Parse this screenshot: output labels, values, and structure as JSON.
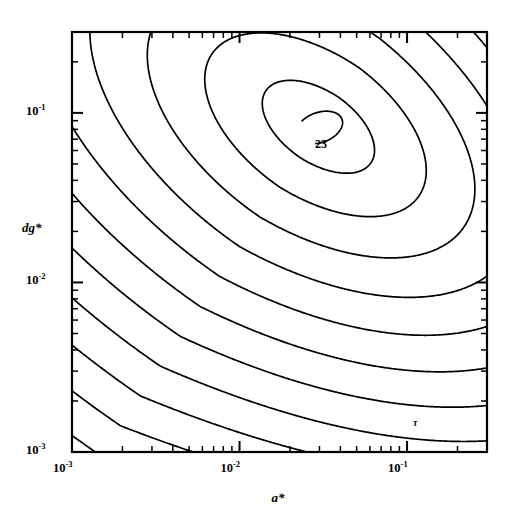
{
  "figure": {
    "background_color": "#ffffff",
    "line_color": "#000000",
    "frame": {
      "left": 72,
      "top": 32,
      "right": 487,
      "bottom": 452
    }
  },
  "axes": {
    "x": {
      "title": "a*",
      "scale": "log",
      "min": 0.001,
      "max": 0.3,
      "tick_labels": [
        {
          "mantissa": "10",
          "exponent": "-3",
          "value": 0.001
        },
        {
          "mantissa": "10",
          "exponent": "-2",
          "value": 0.01
        },
        {
          "mantissa": "10",
          "exponent": "-1",
          "value": 0.1
        }
      ]
    },
    "y": {
      "title": "dg*",
      "scale": "log",
      "min": 0.001,
      "max": 0.3,
      "tick_labels": [
        {
          "mantissa": "10",
          "exponent": "-1",
          "value": 0.1
        },
        {
          "mantissa": "10",
          "exponent": "-2",
          "value": 0.01
        },
        {
          "mantissa": "10",
          "exponent": "-3",
          "value": 0.001
        }
      ]
    }
  },
  "annotations": [
    {
      "name": "peak-contour-label",
      "text": "23",
      "x_px": 315,
      "y_px": 137
    },
    {
      "name": "tau-region-label",
      "text": "τ",
      "x_px": 413,
      "y_px": 417
    }
  ],
  "chart_data": {
    "type": "contour",
    "title": "",
    "xlabel": "a*",
    "ylabel": "dg*",
    "xscale": "log",
    "yscale": "log",
    "xlim": [
      0.001,
      0.3
    ],
    "ylim": [
      0.001,
      0.3
    ],
    "grid": false,
    "legend": null,
    "labeled_contour_levels": [
      23
    ],
    "peak": {
      "a_star": 0.03,
      "dg_star": 0.082,
      "level": 23
    },
    "n_closed_contours": 6,
    "n_open_contours": 14,
    "contours": [
      {
        "level": 23,
        "closed": true,
        "center": [
          0.03,
          0.082
        ],
        "rx": 0.3,
        "ry": 0.18,
        "rot": -28
      },
      {
        "level": 22,
        "closed": true,
        "center": [
          0.024,
          0.066
        ],
        "rx": 0.62,
        "ry": 0.4,
        "rot": -30
      },
      {
        "level": 21,
        "closed": true,
        "center": [
          0.019,
          0.054
        ],
        "rx": 0.86,
        "ry": 0.58,
        "rot": -32
      },
      {
        "level": 20,
        "closed": true,
        "center": [
          0.015,
          0.046
        ],
        "rx": 1.06,
        "ry": 0.74,
        "rot": -33
      },
      {
        "level": 19,
        "closed": true,
        "center": [
          0.012,
          0.04
        ],
        "rx": 1.24,
        "ry": 0.88,
        "rot": -34
      },
      {
        "level": 18,
        "closed": true,
        "center": [
          0.01,
          0.036
        ],
        "rx": 1.4,
        "ry": 1.0,
        "rot": -35
      },
      {
        "level": 17,
        "open": true
      },
      {
        "level": 16,
        "open": true
      },
      {
        "level": 15,
        "open": true
      },
      {
        "level": 14,
        "open": true
      },
      {
        "level": 13,
        "open": true
      },
      {
        "level": 12,
        "open": true
      },
      {
        "level": 11,
        "open": true
      },
      {
        "level": 10,
        "open": true
      },
      {
        "level": 9,
        "open": true
      },
      {
        "level": 8,
        "open": true
      },
      {
        "level": 7,
        "open": true
      },
      {
        "level": 6,
        "open": true
      },
      {
        "level": 5,
        "open": true
      },
      {
        "level": 4,
        "open": true
      }
    ]
  }
}
